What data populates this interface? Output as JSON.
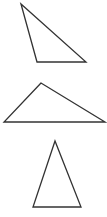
{
  "canvas": {
    "width": 107,
    "height": 217,
    "background": "#ffffff"
  },
  "stroke": {
    "color": "#333333",
    "width": 1.3
  },
  "shapes": [
    {
      "name": "obtuse-triangle-top",
      "points": "21,4 37,62 86,62"
    },
    {
      "name": "obtuse-triangle-middle",
      "points": "41,83 4,122 105,122"
    },
    {
      "name": "isosceles-triangle-bottom",
      "points": "55,141 33,207 81,207"
    }
  ]
}
